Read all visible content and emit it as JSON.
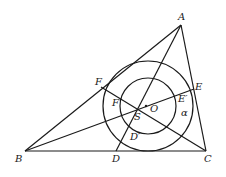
{
  "diagram": {
    "type": "geometry",
    "points": {
      "A": {
        "label": "A",
        "x": 181,
        "y": 25
      },
      "B": {
        "label": "B",
        "x": 25,
        "y": 151
      },
      "C": {
        "label": "C",
        "x": 206,
        "y": 151
      },
      "D": {
        "label": "D",
        "x": 116,
        "y": 151
      },
      "E": {
        "label": "E",
        "x": 194,
        "y": 89
      },
      "F": {
        "label": "F",
        "x": 101,
        "y": 87
      },
      "O": {
        "label": "O",
        "x": 148,
        "y": 106
      },
      "S": {
        "label": "S",
        "x": 145,
        "y": 107
      },
      "Dp": {
        "label": "D′",
        "x": 134,
        "y": 128
      },
      "Ep": {
        "label": "E′",
        "x": 175,
        "y": 99
      },
      "Fp": {
        "label": "F′",
        "x": 119,
        "y": 102
      }
    },
    "angle_label": "α",
    "circles": [
      {
        "name": "outer-circle",
        "cx": 148,
        "cy": 106,
        "r": 45
      },
      {
        "name": "inner-circle",
        "cx": 148,
        "cy": 106,
        "r": 28
      }
    ],
    "segments": [
      [
        "A",
        "B"
      ],
      [
        "B",
        "C"
      ],
      [
        "C",
        "A"
      ],
      [
        "A",
        "D"
      ],
      [
        "B",
        "E"
      ],
      [
        "C",
        "F"
      ]
    ]
  }
}
